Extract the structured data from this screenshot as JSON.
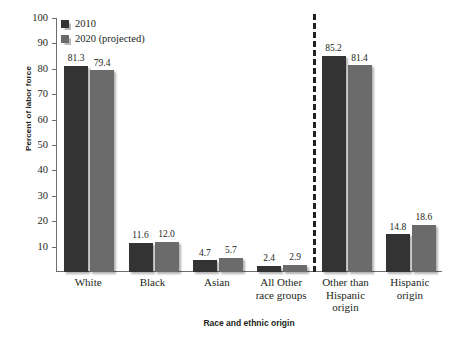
{
  "chart_data": {
    "type": "bar",
    "title": "",
    "xlabel": "Race and ethnic origin",
    "ylabel": "Percent of labor force",
    "ylim": [
      0,
      100
    ],
    "yticks": [
      10,
      20,
      30,
      40,
      50,
      60,
      70,
      80,
      90,
      100
    ],
    "ytick_labels": [
      "10",
      "20",
      "30",
      "40",
      "50",
      "60",
      "70",
      "80",
      "90",
      "100"
    ],
    "grid": false,
    "legend_position": "top-left",
    "categories": [
      "White",
      "Black",
      "Asian",
      "All Other race groups",
      "Other than Hispanic origin",
      "Hispanic origin"
    ],
    "category_lines": [
      [
        "White"
      ],
      [
        "Black"
      ],
      [
        "Asian"
      ],
      [
        "All Other",
        "race groups"
      ],
      [
        "Other than",
        "Hispanic",
        "origin"
      ],
      [
        "Hispanic",
        "origin"
      ]
    ],
    "series": [
      {
        "name": "2010",
        "color": "#333333",
        "values": [
          81.3,
          11.6,
          4.7,
          2.4,
          85.2,
          14.8
        ],
        "value_labels": [
          "81.3",
          "11.6",
          "4.7",
          "2.4",
          "85.2",
          "14.8"
        ]
      },
      {
        "name": "2020 (projected)",
        "color": "#6b6b6b",
        "values": [
          79.4,
          12.0,
          5.7,
          2.9,
          81.4,
          18.6
        ],
        "value_labels": [
          "79.4",
          "12.0",
          "5.7",
          "2.9",
          "81.4",
          "18.6"
        ]
      }
    ],
    "annotations": [
      {
        "type": "vertical-dashed-divider",
        "after_category_index": 3,
        "color": "#231f20",
        "note": "separates race groups from Hispanic-origin groups"
      }
    ]
  },
  "legend": {
    "items": [
      {
        "label": "2010",
        "color": "#333333"
      },
      {
        "label": "2020 (projected)",
        "color": "#6b6b6b"
      }
    ]
  },
  "axes": {
    "y_title": "Percent of labor force",
    "x_title": "Race and ethnic origin"
  },
  "footer": {
    "source_note": ""
  }
}
